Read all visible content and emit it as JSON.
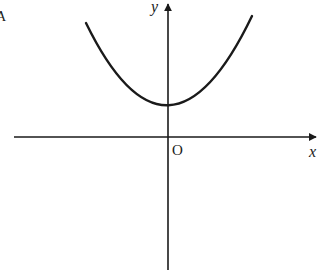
{
  "figure": {
    "type": "function-graph",
    "axes": {
      "x_label": "x",
      "y_label": "y",
      "origin_label": "O"
    },
    "curve": {
      "shape": "parabola",
      "opens": "up",
      "vertex": "on positive y-axis",
      "color": "#1a1a1a"
    },
    "stray_mark": "A",
    "colors": {
      "ink": "#1a1a1a",
      "background": "#ffffff"
    }
  }
}
